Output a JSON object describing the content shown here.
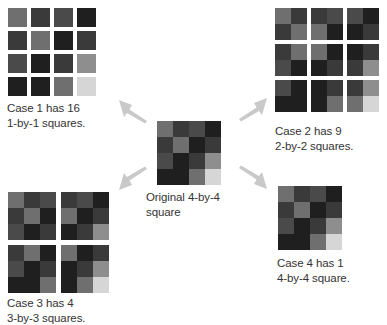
{
  "figure": {
    "title_text": null,
    "palette": {
      "medium_gray": "#6f6f6f",
      "dark": "#3a3a3a",
      "dark_gray": "#4a4a4a",
      "very_dark": "#1f1f1f",
      "light_gray": "#8e8e8e",
      "very_light": "#d6d6d6",
      "background": "#ffffff",
      "arrow": "#c9c9c9",
      "text": "#333333"
    },
    "pattern": {
      "rows": 4,
      "cols": 4,
      "cells": [
        [
          "#6f6f6f",
          "#3a3a3a",
          "#4a4a4a",
          "#1f1f1f"
        ],
        [
          "#3a3a3a",
          "#6f6f6f",
          "#1f1f1f",
          "#3a3a3a"
        ],
        [
          "#4a4a4a",
          "#1f1f1f",
          "#3a3a3a",
          "#8e8e8e"
        ],
        [
          "#1f1f1f",
          "#1f1f1f",
          "#6f6f6f",
          "#d6d6d6"
        ]
      ]
    },
    "original": {
      "caption_line1": "Original 4-by-4",
      "caption_line2": "square",
      "caption": "Original 4-by-4\nsquare"
    },
    "cases": [
      {
        "id": "case-1",
        "caption_line1": "Case 1 has 16",
        "caption_line2": "1-by-1 squares.",
        "caption": "Case 1 has 16\n1-by-1 squares.",
        "count": 16,
        "sub_square_size": 1,
        "blocks_across": 4,
        "blocks_down": 4
      },
      {
        "id": "case-2",
        "caption_line1": "Case 2 has 9",
        "caption_line2": "2-by-2 squares.",
        "caption": "Case 2 has 9\n2-by-2 squares.",
        "count": 9,
        "sub_square_size": 2,
        "blocks_across": 3,
        "blocks_down": 3
      },
      {
        "id": "case-3",
        "caption_line1": "Case 3 has 4",
        "caption_line2": "3-by-3 squares.",
        "caption": "Case 3 has 4\n3-by-3 squares.",
        "count": 4,
        "sub_square_size": 3,
        "blocks_across": 2,
        "blocks_down": 2
      },
      {
        "id": "case-4",
        "caption_line1": "Case 4 has 1",
        "caption_line2": "4-by-4 square.",
        "caption": "Case 4 has 1\n4-by-4 square.",
        "count": 1,
        "sub_square_size": 4,
        "blocks_across": 1,
        "blocks_down": 1
      }
    ],
    "arrows": [
      {
        "name": "arrow-up-left",
        "direction": "up-left"
      },
      {
        "name": "arrow-up-right",
        "direction": "up-right"
      },
      {
        "name": "arrow-down-left",
        "direction": "down-left"
      },
      {
        "name": "arrow-down-right",
        "direction": "down-right"
      }
    ]
  }
}
